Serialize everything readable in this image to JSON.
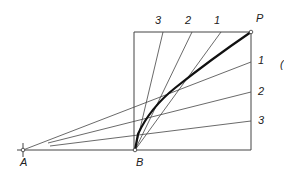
{
  "diagram": {
    "title": "",
    "points": {
      "A": {
        "label": "A",
        "x": 23,
        "y": 150
      },
      "B": {
        "label": "B",
        "x": 135,
        "y": 150
      },
      "P": {
        "label": "P",
        "x": 251,
        "y": 32
      }
    },
    "box": {
      "left": 134,
      "top": 32,
      "right": 251,
      "bottom": 150
    },
    "top_divisions": [
      {
        "label": "3",
        "x": 163
      },
      {
        "label": "2",
        "x": 192
      },
      {
        "label": "1",
        "x": 221
      }
    ],
    "right_divisions": [
      {
        "label": "1",
        "y": 62
      },
      {
        "label": "2",
        "y": 92
      },
      {
        "label": "3",
        "y": 121
      }
    ],
    "stray_mark": "(",
    "line_color": "#333333",
    "curve_color": "#111111"
  }
}
